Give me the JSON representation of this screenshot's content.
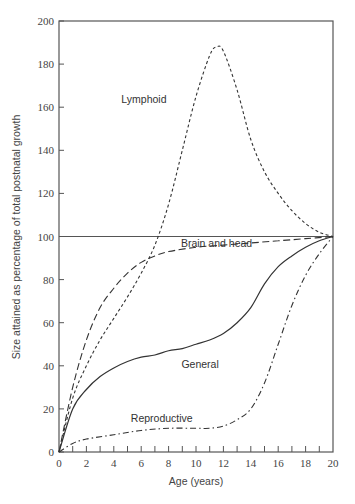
{
  "chart_data": {
    "type": "line",
    "title": "",
    "xlabel": "Age (years)",
    "ylabel": "Size attained as percentage of total postnatal growth",
    "xlim": [
      0,
      20
    ],
    "ylim": [
      0,
      200
    ],
    "x_ticks_labeled": [
      0,
      2,
      4,
      6,
      8,
      10,
      12,
      14,
      16,
      18,
      20
    ],
    "x_ticks_minor_step": 1,
    "y_ticks": [
      0,
      20,
      40,
      60,
      80,
      100,
      120,
      140,
      160,
      180,
      200
    ],
    "grid": false,
    "reference_line": {
      "y": 100,
      "style": "solid"
    },
    "legend": "inline annotations",
    "series": [
      {
        "name": "Lymphoid",
        "style": "short-dash",
        "x": [
          0,
          1,
          2,
          3,
          4,
          5,
          6,
          7,
          8,
          9,
          10,
          11,
          11.5,
          12,
          13,
          14,
          15,
          16,
          17,
          18,
          19,
          20
        ],
        "values": [
          0,
          25,
          40,
          52,
          62,
          72,
          83,
          96,
          115,
          140,
          165,
          184,
          188,
          186,
          168,
          145,
          130,
          120,
          112,
          106,
          102,
          100
        ]
      },
      {
        "name": "Brain and head",
        "style": "long-dash",
        "x": [
          0,
          1,
          2,
          3,
          4,
          5,
          6,
          7,
          8,
          10,
          12,
          14,
          16,
          18,
          20
        ],
        "values": [
          0,
          30,
          52,
          67,
          76,
          83,
          88,
          91,
          93,
          95,
          96,
          97,
          98,
          99,
          100
        ]
      },
      {
        "name": "General",
        "style": "solid",
        "x": [
          0,
          1,
          2,
          3,
          4,
          5,
          6,
          7,
          8,
          9,
          10,
          11,
          12,
          13,
          14,
          15,
          16,
          17,
          18,
          19,
          20
        ],
        "values": [
          0,
          20,
          29,
          35,
          39,
          42,
          44,
          45,
          47,
          48,
          50,
          52,
          55,
          60,
          67,
          78,
          86,
          91,
          95,
          98,
          100
        ]
      },
      {
        "name": "Reproductive",
        "style": "dash-dot",
        "x": [
          0,
          1,
          2,
          4,
          6,
          8,
          10,
          11,
          12,
          13,
          14,
          15,
          16,
          17,
          18,
          19,
          20
        ],
        "values": [
          0,
          4,
          6,
          8,
          10,
          11,
          11,
          11,
          12,
          15,
          20,
          32,
          50,
          68,
          82,
          92,
          100
        ]
      }
    ],
    "annotations": [
      {
        "text": "Lymphoid",
        "x": 6.2,
        "y": 162
      },
      {
        "text": "Brain and head",
        "x": 11.5,
        "y": 95
      },
      {
        "text": "General",
        "x": 10.3,
        "y": 39
      },
      {
        "text": "Reproductive",
        "x": 7.5,
        "y": 14
      }
    ]
  }
}
